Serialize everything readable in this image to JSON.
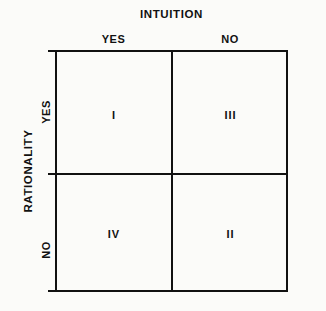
{
  "figure": {
    "type": "2x2-matrix",
    "background_color": "#fbfbf9",
    "line_color": "#111111"
  },
  "top_axis": {
    "title": "INTUITION",
    "columns": [
      {
        "label": "YES"
      },
      {
        "label": "NO"
      }
    ]
  },
  "left_axis": {
    "title": "RATIONALITY",
    "rows": [
      {
        "label": "YES"
      },
      {
        "label": "NO"
      }
    ]
  },
  "quadrants": [
    {
      "position": "top-left",
      "intuition": "YES",
      "rationality": "YES",
      "label": "I"
    },
    {
      "position": "top-right",
      "intuition": "NO",
      "rationality": "YES",
      "label": "III"
    },
    {
      "position": "bottom-left",
      "intuition": "YES",
      "rationality": "NO",
      "label": "IV"
    },
    {
      "position": "bottom-right",
      "intuition": "NO",
      "rationality": "NO",
      "label": "II"
    }
  ]
}
